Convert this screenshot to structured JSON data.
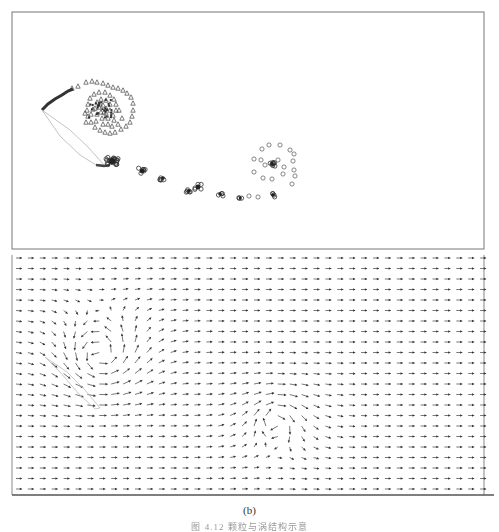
{
  "figure": {
    "subfigure_label": "(b)",
    "caption_text": "图 4.12 颗粒与涡结构示意"
  },
  "chart_data": [
    {
      "type": "scatter",
      "title": "",
      "xlabel": "",
      "ylabel": "",
      "grid": false,
      "frame": {
        "x": 12,
        "y": 12,
        "w": 472,
        "h": 237
      },
      "description": "Particle positions: a dense triangle-marker cloud at upper left with a trailing streak, then a chain of circle-marker clusters descending to the right, ending at a diffuse circle cloud at right-center.",
      "series": [
        {
          "name": "triangles",
          "marker": "triangle",
          "points": [
            [
              72,
              88
            ],
            [
              78,
              86
            ],
            [
              86,
              82
            ],
            [
              92,
              81
            ],
            [
              97,
              82
            ],
            [
              103,
              83
            ],
            [
              108,
              85
            ],
            [
              113,
              87
            ],
            [
              118,
              88
            ],
            [
              123,
              90
            ],
            [
              127,
              93
            ],
            [
              131,
              97
            ],
            [
              133,
              103
            ],
            [
              133,
              110
            ],
            [
              132,
              116
            ],
            [
              130,
              122
            ],
            [
              126,
              126
            ],
            [
              121,
              129
            ],
            [
              115,
              132
            ],
            [
              110,
              133
            ],
            [
              105,
              132
            ],
            [
              100,
              130
            ],
            [
              95,
              127
            ],
            [
              91,
              122
            ],
            [
              88,
              116
            ],
            [
              87,
              110
            ],
            [
              88,
              104
            ],
            [
              90,
              98
            ],
            [
              94,
              94
            ],
            [
              99,
              92
            ],
            [
              105,
              92
            ],
            [
              110,
              95
            ],
            [
              114,
              99
            ],
            [
              116,
              104
            ],
            [
              116,
              110
            ],
            [
              113,
              115
            ],
            [
              108,
              118
            ],
            [
              102,
              118
            ],
            [
              97,
              114
            ],
            [
              95,
              108
            ],
            [
              97,
              102
            ],
            [
              101,
              99
            ],
            [
              106,
              100
            ],
            [
              110,
              104
            ],
            [
              110,
              110
            ],
            [
              106,
              113
            ],
            [
              101,
              112
            ],
            [
              99,
              107
            ],
            [
              103,
              105
            ],
            [
              106,
              108
            ],
            [
              93,
              109
            ],
            [
              119,
              110
            ],
            [
              122,
              118
            ],
            [
              118,
              124
            ],
            [
              112,
              126
            ],
            [
              96,
              121
            ],
            [
              91,
              114
            ],
            [
              85,
              113
            ],
            [
              86,
              122
            ],
            [
              103,
              124
            ],
            [
              108,
              124
            ],
            [
              114,
              120
            ],
            [
              100,
              104
            ],
            [
              104,
              112
            ]
          ]
        },
        {
          "name": "streak",
          "marker": "line",
          "points": [
            [
              42,
              110
            ],
            [
              48,
              104
            ],
            [
              55,
              99
            ],
            [
              62,
              95
            ],
            [
              68,
              91
            ],
            [
              73,
              89
            ]
          ],
          "loop": [
            [
              42,
              110
            ],
            [
              60,
              136
            ],
            [
              80,
              155
            ],
            [
              96,
              165
            ],
            [
              104,
              165
            ],
            [
              88,
              147
            ],
            [
              70,
              130
            ],
            [
              42,
              110
            ]
          ]
        },
        {
          "name": "circles",
          "marker": "circle",
          "clusters": [
            {
              "cx": 112,
              "cy": 161,
              "n": 22,
              "spread": 6
            },
            {
              "cx": 142,
              "cy": 171,
              "n": 6,
              "spread": 4
            },
            {
              "cx": 163,
              "cy": 178,
              "n": 5,
              "spread": 3
            },
            {
              "cx": 189,
              "cy": 191,
              "n": 5,
              "spread": 3
            },
            {
              "cx": 198,
              "cy": 187,
              "n": 5,
              "spread": 4
            },
            {
              "cx": 220,
              "cy": 194,
              "n": 4,
              "spread": 3
            },
            {
              "cx": 240,
              "cy": 198,
              "n": 3,
              "spread": 2
            },
            {
              "cx": 272,
              "cy": 164,
              "n": 8,
              "spread": 3
            },
            {
              "cx": 273,
              "cy": 195,
              "n": 4,
              "spread": 3
            }
          ],
          "ring_points": [
            [
              262,
              149
            ],
            [
              269,
              145
            ],
            [
              280,
              145
            ],
            [
              290,
              150
            ],
            [
              294,
              154
            ],
            [
              293,
              161
            ],
            [
              294,
              170
            ],
            [
              295,
              176
            ],
            [
              292,
              184
            ],
            [
              254,
              159
            ],
            [
              254,
              172
            ],
            [
              263,
              178
            ],
            [
              272,
              179
            ],
            [
              283,
              174
            ],
            [
              284,
              167
            ],
            [
              265,
              165
            ],
            [
              261,
              160
            ],
            [
              278,
              160
            ],
            [
              258,
              197
            ],
            [
              249,
              196
            ]
          ]
        }
      ]
    },
    {
      "type": "quiver",
      "title": "",
      "xlabel": "",
      "ylabel": "",
      "grid": false,
      "frame": {
        "x": 12,
        "y": 255,
        "w": 472,
        "h": 240
      },
      "grid_spec": {
        "x0": 16,
        "dx": 11.9,
        "cols": 40,
        "y0": 258,
        "dy": 10.5,
        "rows": 23
      },
      "base_flow": {
        "u": 1.0,
        "v": 0.0
      },
      "vortices": [
        {
          "cx": 100,
          "cy": 355,
          "strength": -2.2,
          "radius": 42
        },
        {
          "cx": 275,
          "cy": 420,
          "strength": 1.1,
          "radius": 38
        }
      ],
      "arrow_scale": 6,
      "separatrix_loop": [
        [
          45,
          357
        ],
        [
          60,
          372
        ],
        [
          78,
          393
        ],
        [
          95,
          409
        ],
        [
          100,
          408
        ],
        [
          85,
          390
        ],
        [
          67,
          372
        ],
        [
          45,
          357
        ]
      ]
    }
  ]
}
